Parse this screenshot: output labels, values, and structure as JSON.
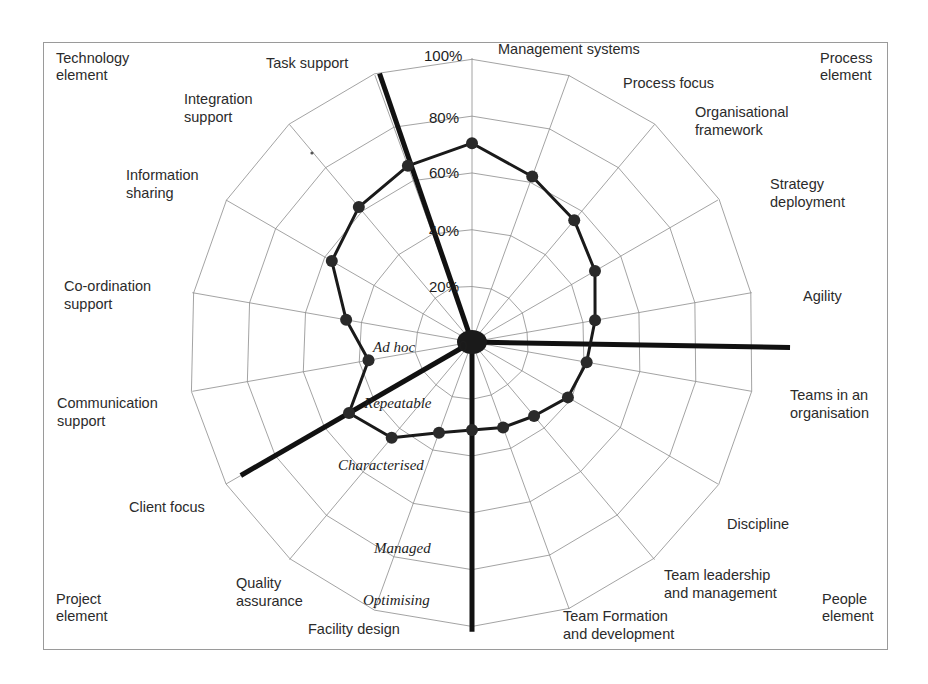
{
  "chart_data": {
    "type": "radar",
    "title": "",
    "subtitle": "",
    "xlabel": "",
    "ylabel": "",
    "grid": true,
    "legend_position": "none",
    "rlim": [
      0,
      100
    ],
    "r_tick_labels": [
      "0",
      "20%",
      "40%",
      "60%",
      "80%",
      "100%"
    ],
    "r_tick_values": [
      0,
      20,
      40,
      60,
      80,
      100
    ],
    "maturity_levels": [
      "Ad hoc",
      "Repeatable",
      "Characterised",
      "Managed",
      "Optimising"
    ],
    "categories": [
      "Management systems",
      "Process focus",
      "Organisational framework",
      "Strategy deployment",
      "Agility",
      "Teams in an organisation",
      "Discipline",
      "Team leadership and management",
      "Team Formation and development",
      "Facility design",
      "Quality assurance",
      "Client focus",
      "Communication support",
      "Co-ordination support",
      "Information sharing",
      "Integration support",
      "Task support",
      "Process maturity"
    ],
    "series": [
      {
        "name": "Maturity profile",
        "values": [
          70,
          62,
          56,
          50,
          44,
          41,
          39,
          34,
          32,
          31,
          34,
          44,
          50,
          37,
          45,
          57,
          62,
          66
        ]
      }
    ],
    "group_labels": [
      "Technology element",
      "Process element",
      "People element",
      "Project element"
    ]
  },
  "corner_labels": {
    "top_left": {
      "line1": "Technology",
      "line2": "element"
    },
    "top_right": {
      "line1": "Process",
      "line2": "element"
    },
    "bottom_right": {
      "line1": "People",
      "line2": "element"
    },
    "bottom_left": {
      "line1": "Project",
      "line2": "element"
    }
  },
  "axis_labels": [
    {
      "id": "management-systems",
      "lines": [
        "Management systems"
      ],
      "x": 498,
      "y": 54,
      "anchor": "start"
    },
    {
      "id": "process-focus",
      "lines": [
        "Process focus"
      ],
      "x": 623,
      "y": 88,
      "anchor": "start"
    },
    {
      "id": "organisational-framework",
      "lines": [
        "Organisational",
        "framework"
      ],
      "x": 695,
      "y": 117,
      "anchor": "start"
    },
    {
      "id": "strategy-deployment",
      "lines": [
        "Strategy",
        "deployment"
      ],
      "x": 770,
      "y": 189,
      "anchor": "start"
    },
    {
      "id": "agility",
      "lines": [
        "Agility"
      ],
      "x": 803,
      "y": 301,
      "anchor": "start"
    },
    {
      "id": "teams-in-an-organisation",
      "lines": [
        "Teams in an",
        "organisation"
      ],
      "x": 790,
      "y": 400,
      "anchor": "start"
    },
    {
      "id": "discipline",
      "lines": [
        "Discipline"
      ],
      "x": 727,
      "y": 529,
      "anchor": "start"
    },
    {
      "id": "team-leadership-and-management",
      "lines": [
        "Team leadership",
        "and management"
      ],
      "x": 664,
      "y": 580,
      "anchor": "start"
    },
    {
      "id": "team-formation-and-development",
      "lines": [
        "Team Formation",
        "and development"
      ],
      "x": 563,
      "y": 621,
      "anchor": "start"
    },
    {
      "id": "facility-design",
      "lines": [
        "Facility design"
      ],
      "x": 308,
      "y": 634,
      "anchor": "start"
    },
    {
      "id": "quality-assurance",
      "lines": [
        "Quality",
        "assurance"
      ],
      "x": 236,
      "y": 588,
      "anchor": "start"
    },
    {
      "id": "client-focus",
      "lines": [
        "Client focus"
      ],
      "x": 129,
      "y": 512,
      "anchor": "start"
    },
    {
      "id": "communication-support",
      "lines": [
        "Communication",
        "support"
      ],
      "x": 57,
      "y": 408,
      "anchor": "start"
    },
    {
      "id": "co-ordination-support",
      "lines": [
        "Co-ordination",
        "support"
      ],
      "x": 64,
      "y": 291,
      "anchor": "start"
    },
    {
      "id": "information-sharing",
      "lines": [
        "Information",
        "sharing"
      ],
      "x": 126,
      "y": 180,
      "anchor": "start"
    },
    {
      "id": "integration-support",
      "lines": [
        "Integration",
        "support"
      ],
      "x": 184,
      "y": 104,
      "anchor": "start"
    },
    {
      "id": "task-support",
      "lines": [
        "Task support"
      ],
      "x": 266,
      "y": 68,
      "anchor": "start"
    }
  ],
  "tick_labels": [
    {
      "text": "0",
      "x": 459,
      "y": 351
    },
    {
      "text": "20%",
      "x": 429,
      "y": 292
    },
    {
      "text": "40%",
      "x": 429,
      "y": 236
    },
    {
      "text": "60%",
      "x": 429,
      "y": 178
    },
    {
      "text": "80%",
      "x": 429,
      "y": 123
    },
    {
      "text": "100%",
      "x": 424,
      "y": 61
    }
  ],
  "level_labels": [
    {
      "text": "Ad hoc",
      "x": 373,
      "y": 352
    },
    {
      "text": "Repeatable",
      "x": 364,
      "y": 408
    },
    {
      "text": "Characterised",
      "x": 338,
      "y": 470
    },
    {
      "text": "Managed",
      "x": 374,
      "y": 553
    },
    {
      "text": "Optimising",
      "x": 363,
      "y": 605
    }
  ],
  "colors": {
    "grid": "#8c8c8c",
    "series": "#1a1a1a",
    "divider": "#111111",
    "frame": "#9a9a9a",
    "text": "#2b2b2b",
    "background": "#ffffff"
  }
}
